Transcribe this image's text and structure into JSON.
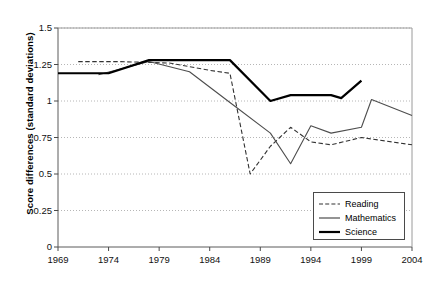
{
  "chart_data": {
    "type": "line",
    "title": "",
    "xlabel": "",
    "ylabel": "Score differences (standard deviations)",
    "xlim": [
      1969,
      2004
    ],
    "ylim": [
      0,
      1.5
    ],
    "ytick_values": [
      0,
      0.25,
      0.5,
      0.75,
      1,
      1.25,
      1.5
    ],
    "ytick_labels": [
      "0",
      "0.25",
      "0.5",
      "0.75",
      "1",
      "1.25",
      "1.5"
    ],
    "xtick_values": [
      1969,
      1974,
      1979,
      1984,
      1989,
      1994,
      1999,
      2004
    ],
    "xtick_labels": [
      "1969",
      "1974",
      "1979",
      "1984",
      "1989",
      "1994",
      "1999",
      "2004"
    ],
    "grid": "horizontal-dotted",
    "legend_position": "bottom-right",
    "series": [
      {
        "name": "Reading",
        "style": "dashed",
        "color": "#333333",
        "width": 1.1,
        "points": [
          [
            1971,
            1.27
          ],
          [
            1975,
            1.27
          ],
          [
            1980,
            1.26
          ],
          [
            1984,
            1.21
          ],
          [
            1986,
            1.19
          ],
          [
            1988,
            0.5
          ],
          [
            1990,
            0.69
          ],
          [
            1992,
            0.82
          ],
          [
            1994,
            0.72
          ],
          [
            1996,
            0.7
          ],
          [
            1999,
            0.75
          ],
          [
            2004,
            0.7
          ]
        ]
      },
      {
        "name": "Mathematics",
        "style": "solid-thin",
        "color": "#4d4d4d",
        "width": 1.1,
        "points": [
          [
            1973,
            1.18
          ],
          [
            1978,
            1.27
          ],
          [
            1982,
            1.2
          ],
          [
            1986,
            0.99
          ],
          [
            1990,
            0.78
          ],
          [
            1992,
            0.57
          ],
          [
            1994,
            0.83
          ],
          [
            1996,
            0.78
          ],
          [
            1999,
            0.82
          ],
          [
            2000,
            1.01
          ],
          [
            2004,
            0.9
          ]
        ]
      },
      {
        "name": "Science",
        "style": "solid-thick",
        "color": "#000000",
        "width": 2.2,
        "points": [
          [
            1969,
            1.19
          ],
          [
            1974,
            1.19
          ],
          [
            1978,
            1.28
          ],
          [
            1986,
            1.28
          ],
          [
            1990,
            1.0
          ],
          [
            1992,
            1.04
          ],
          [
            1996,
            1.04
          ],
          [
            1997,
            1.02
          ],
          [
            1999,
            1.14
          ]
        ]
      }
    ]
  },
  "legend": {
    "items": [
      {
        "label": "Reading",
        "key": "dashed-line-key"
      },
      {
        "label": "Mathematics",
        "key": "thin-solid-line-key"
      },
      {
        "label": "Science",
        "key": "thick-solid-line-key"
      }
    ]
  },
  "axes": {
    "y_title": "Score differences (standard deviations)"
  }
}
